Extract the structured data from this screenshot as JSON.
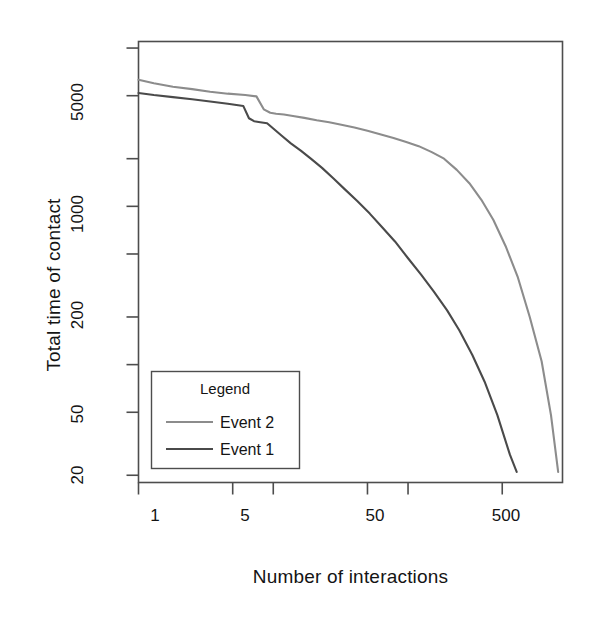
{
  "figure": {
    "title_clipped": "Degree",
    "background": "#ffffff",
    "frame_color": "#4d4d4d"
  },
  "chart_data": {
    "type": "line",
    "title": "",
    "xlabel": "Number of interactions",
    "ylabel": "Total time of contact",
    "xscale": "log",
    "yscale": "log",
    "grid": false,
    "xlim": [
      1,
      1400
    ],
    "ylim": [
      18,
      11000
    ],
    "xticks": [
      1,
      5,
      10,
      50,
      100,
      500
    ],
    "xtick_labels": [
      "1",
      "5",
      "",
      "50",
      "",
      "500"
    ],
    "yticks": [
      20,
      50,
      100,
      200,
      500,
      1000,
      2000,
      5000,
      10000
    ],
    "ytick_labels": [
      "20",
      "50",
      "",
      "200",
      "",
      "1000",
      "",
      "5000",
      ""
    ],
    "legend": {
      "title": "Legend",
      "position": "bottom-left",
      "entries": [
        {
          "name": "Event 2",
          "color": "#8c8c8c"
        },
        {
          "name": "Event 1",
          "color": "#4a4a4a"
        }
      ]
    },
    "series": [
      {
        "name": "Event 2",
        "color": "#8c8c8c",
        "x": [
          1,
          1.3,
          1.8,
          2.5,
          3.4,
          4.6,
          6.2,
          7.5,
          8.5,
          9.5,
          10.5,
          12,
          14,
          17,
          21,
          26,
          32,
          40,
          50,
          62,
          78,
          97,
          120,
          150,
          185,
          230,
          285,
          350,
          430,
          530,
          650,
          800,
          980,
          1150,
          1300
        ],
        "y": [
          6300,
          6000,
          5700,
          5500,
          5300,
          5150,
          5050,
          4950,
          4100,
          3900,
          3850,
          3800,
          3720,
          3620,
          3500,
          3400,
          3280,
          3150,
          3000,
          2850,
          2700,
          2550,
          2400,
          2200,
          2000,
          1700,
          1400,
          1100,
          820,
          560,
          360,
          200,
          105,
          48,
          21
        ]
      },
      {
        "name": "Event 1",
        "color": "#4a4a4a",
        "x": [
          1,
          1.3,
          1.8,
          2.5,
          3.4,
          4.6,
          6.0,
          6.6,
          7.2,
          8.0,
          9.0,
          10,
          11.5,
          13.5,
          16,
          19,
          23,
          28,
          34,
          42,
          52,
          64,
          80,
          100,
          125,
          155,
          195,
          240,
          300,
          370,
          460,
          570,
          640
        ],
        "y": [
          5200,
          5050,
          4900,
          4750,
          4600,
          4450,
          4300,
          3600,
          3450,
          3400,
          3350,
          3100,
          2800,
          2500,
          2250,
          2000,
          1750,
          1500,
          1280,
          1080,
          900,
          740,
          600,
          470,
          370,
          290,
          220,
          165,
          115,
          78,
          48,
          27,
          21
        ]
      }
    ]
  },
  "ytick_text": [
    "5000",
    "1000",
    "200",
    "50",
    "20"
  ],
  "xtick_text": [
    "1",
    "5",
    "50",
    "500"
  ]
}
